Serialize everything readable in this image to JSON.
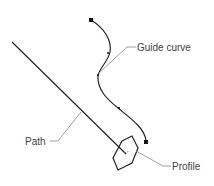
{
  "diagram": {
    "labels": {
      "guide_curve": "Guide curve",
      "path": "Path",
      "profile": "Profile"
    },
    "colors": {
      "stroke": "#222222",
      "leader": "#888888",
      "text": "#444444",
      "background": "#ffffff"
    }
  }
}
